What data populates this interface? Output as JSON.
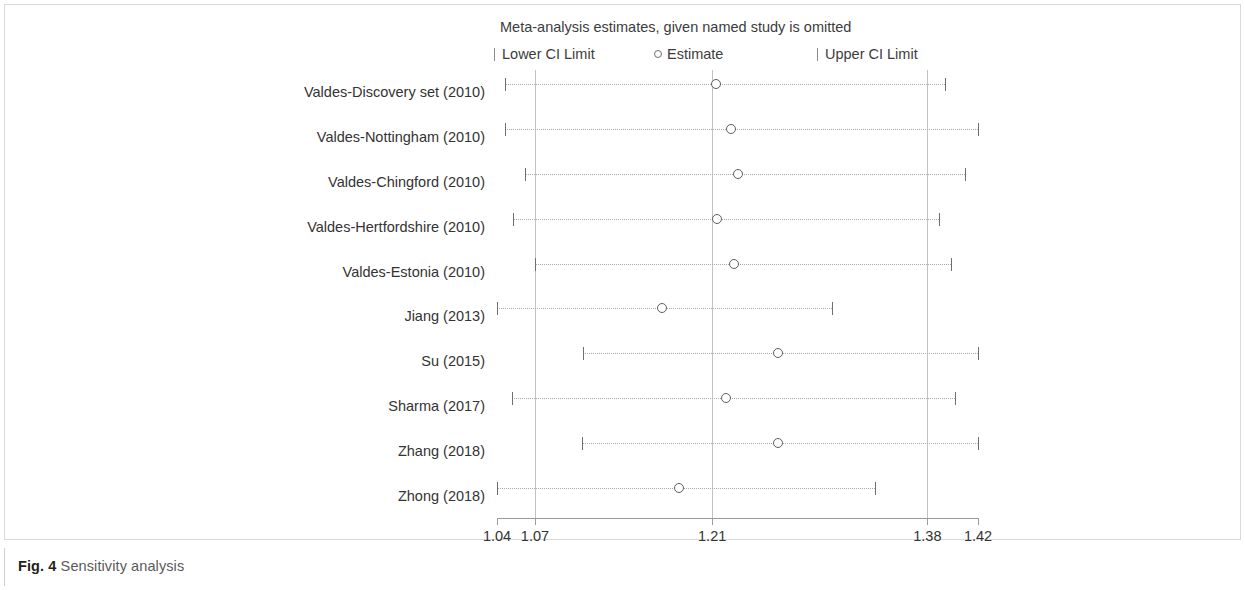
{
  "caption": {
    "label": "Fig. 4",
    "text": "Sensitivity analysis"
  },
  "chart_data": {
    "type": "scatter",
    "title": "Meta-analysis estimates, given named study is omitted",
    "xlabel": "",
    "ylabel": "",
    "xlim": [
      1.04,
      1.42
    ],
    "grid": false,
    "legend_position": "top",
    "legend": [
      {
        "key": "lower",
        "label": "Lower CI Limit",
        "marker": "tick"
      },
      {
        "key": "estimate",
        "label": "Estimate",
        "marker": "circle"
      },
      {
        "key": "upper",
        "label": "Upper CI Limit",
        "marker": "tick"
      }
    ],
    "xticks": [
      1.04,
      1.07,
      1.21,
      1.38,
      1.42
    ],
    "xticklabels": [
      "1.04",
      "1.07",
      "1.21",
      "1.38",
      "1.42"
    ],
    "reference_lines": [
      1.07,
      1.21,
      1.38
    ],
    "categories": [
      "Valdes-Discovery set (2010)",
      "Valdes-Nottingham (2010)",
      "Valdes-Chingford (2010)",
      "Valdes-Hertfordshire (2010)",
      "Valdes-Estonia (2010)",
      "Jiang (2013)",
      "Su (2015)",
      "Sharma (2017)",
      "Zhang (2018)",
      "Zhong (2018)"
    ],
    "series": [
      {
        "name": "Estimate",
        "values": [
          1.213,
          1.225,
          1.23,
          1.214,
          1.227,
          1.17,
          1.262,
          1.221,
          1.262,
          1.184
        ]
      },
      {
        "name": "Lower CI Limit",
        "values": [
          1.046,
          1.046,
          1.062,
          1.053,
          1.07,
          1.04,
          1.108,
          1.052,
          1.107,
          1.04
        ]
      },
      {
        "name": "Upper CI Limit",
        "values": [
          1.394,
          1.42,
          1.41,
          1.389,
          1.399,
          1.305,
          1.42,
          1.402,
          1.42,
          1.339
        ]
      }
    ],
    "points": [
      {
        "study": "Valdes-Discovery set (2010)",
        "estimate": 1.213,
        "lower": 1.046,
        "upper": 1.394
      },
      {
        "study": "Valdes-Nottingham (2010)",
        "estimate": 1.225,
        "lower": 1.046,
        "upper": 1.42
      },
      {
        "study": "Valdes-Chingford (2010)",
        "estimate": 1.23,
        "lower": 1.062,
        "upper": 1.41
      },
      {
        "study": "Valdes-Hertfordshire (2010)",
        "estimate": 1.214,
        "lower": 1.053,
        "upper": 1.389
      },
      {
        "study": "Valdes-Estonia (2010)",
        "estimate": 1.227,
        "lower": 1.07,
        "upper": 1.399
      },
      {
        "study": "Jiang (2013)",
        "estimate": 1.17,
        "lower": 1.04,
        "upper": 1.305
      },
      {
        "study": "Su (2015)",
        "estimate": 1.262,
        "lower": 1.108,
        "upper": 1.42
      },
      {
        "study": "Sharma (2017)",
        "estimate": 1.221,
        "lower": 1.052,
        "upper": 1.402
      },
      {
        "study": "Zhang (2018)",
        "estimate": 1.262,
        "lower": 1.107,
        "upper": 1.42
      },
      {
        "study": "Zhong (2018)",
        "estimate": 1.184,
        "lower": 1.04,
        "upper": 1.339
      }
    ]
  }
}
